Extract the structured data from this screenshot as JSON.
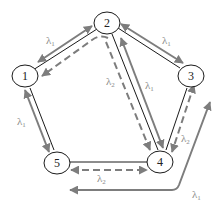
{
  "diagram": {
    "title": "",
    "colors": {
      "edge": "#1a1a1a",
      "flow": "#7d7d7d",
      "label": "#8a8a8a",
      "node_fill": "#ffffff"
    },
    "nodes": [
      {
        "id": "1",
        "label": "1"
      },
      {
        "id": "2",
        "label": "2"
      },
      {
        "id": "3",
        "label": "3"
      },
      {
        "id": "4",
        "label": "4"
      },
      {
        "id": "5",
        "label": "5"
      }
    ],
    "edges": [
      {
        "from": "1",
        "to": "2"
      },
      {
        "from": "2",
        "to": "3"
      },
      {
        "from": "2",
        "to": "4"
      },
      {
        "from": "3",
        "to": "4"
      },
      {
        "from": "4",
        "to": "5"
      },
      {
        "from": "5",
        "to": "1"
      }
    ],
    "flows": [
      {
        "id": "f12",
        "between": [
          "1",
          "2"
        ],
        "style": "solid",
        "direction": "both",
        "label": "λ1"
      },
      {
        "id": "f21",
        "between": [
          "2",
          "1"
        ],
        "style": "dashed",
        "direction": "to-1",
        "label": ""
      },
      {
        "id": "f23",
        "between": [
          "2",
          "3"
        ],
        "style": "solid",
        "direction": "both",
        "label": "λ1"
      },
      {
        "id": "f24a",
        "between": [
          "2",
          "4"
        ],
        "style": "dashed",
        "direction": "to-4",
        "label": "λ2"
      },
      {
        "id": "f24b",
        "between": [
          "2",
          "4"
        ],
        "style": "solid",
        "direction": "both",
        "label": "λ1"
      },
      {
        "id": "f34",
        "between": [
          "3",
          "4"
        ],
        "style": "dashed",
        "direction": "both",
        "label": "λ2"
      },
      {
        "id": "f15",
        "between": [
          "1",
          "5"
        ],
        "style": "solid",
        "direction": "both",
        "label": "λ1"
      },
      {
        "id": "f54",
        "between": [
          "5",
          "4"
        ],
        "style": "dashed",
        "direction": "both",
        "label": "λ2"
      },
      {
        "id": "fext",
        "between": [
          "external",
          "external"
        ],
        "style": "solid",
        "direction": "both",
        "label": "λ1"
      }
    ],
    "labels": {
      "lambda": "λ",
      "sub1": "1",
      "sub2": "2"
    }
  }
}
